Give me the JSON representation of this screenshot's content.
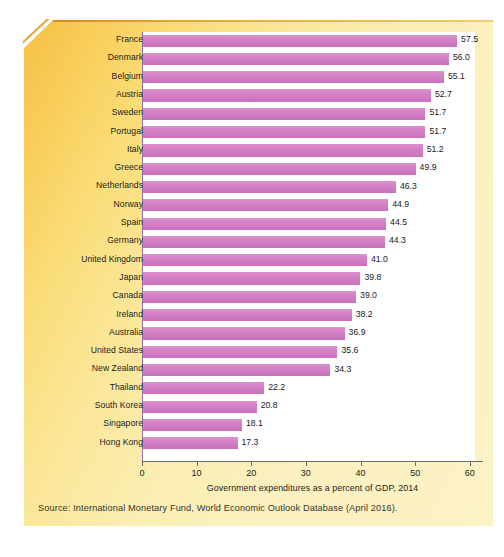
{
  "figure": {
    "source_note": "Source: International Monetary Fund, World Economic Outlook Database (April 2016).",
    "panel_color": "#fbeeb4",
    "panel_accent_color": "#f6bf46",
    "bar_color": "#d27fc4",
    "plot_background": "#ffffff"
  },
  "chart_data": {
    "type": "bar",
    "orientation": "horizontal",
    "title": "",
    "subtitle": "",
    "xlabel": "Government expenditures as a percent of GDP, 2014",
    "ylabel": "",
    "xlim": [
      0,
      62.5
    ],
    "xticks": [
      0,
      10,
      20,
      30,
      40,
      50,
      60
    ],
    "xtick_labels": [
      "0",
      "10",
      "20",
      "30",
      "40",
      "50",
      "60"
    ],
    "grid": false,
    "legend": null,
    "series_color": "#d27fc4",
    "value_label_format": "one-decimal",
    "categories": [
      "France",
      "Denmark",
      "Belgium",
      "Austria",
      "Sweden",
      "Portugal",
      "Italy",
      "Greece",
      "Netherlands",
      "Norway",
      "Spain",
      "Germany",
      "United Kingdom",
      "Japan",
      "Canada",
      "Ireland",
      "Australia",
      "United States",
      "New Zealand",
      "Thailand",
      "South Korea",
      "Singapore",
      "Hong Kong"
    ],
    "values": [
      57.5,
      56.0,
      55.1,
      52.7,
      51.7,
      51.7,
      51.2,
      49.9,
      46.3,
      44.9,
      44.5,
      44.3,
      41.0,
      39.8,
      39.0,
      38.2,
      36.9,
      35.6,
      34.3,
      22.2,
      20.8,
      18.1,
      17.3
    ],
    "value_labels": [
      "57.5",
      "56.0",
      "55.1",
      "52.7",
      "51.7",
      "51.7",
      "51.2",
      "49.9",
      "46.3",
      "44.9",
      "44.5",
      "44.3",
      "41.0",
      "39.8",
      "39.0",
      "38.2",
      "36.9",
      "35.6",
      "34.3",
      "22.2",
      "20.8",
      "18.1",
      "17.3"
    ]
  }
}
